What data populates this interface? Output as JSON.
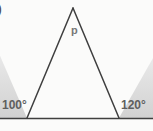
{
  "figure": {
    "item_marker": ")",
    "background_color": "#fbfbfa",
    "stroke_color": "#3f3f3f",
    "shade_color": "#d8d8d8",
    "label_color": "#6d6d6d",
    "apex_label": "p",
    "left_exterior_angle": "100°",
    "right_exterior_angle": "120°",
    "baseline_label": "baseline",
    "triangle": {
      "apex": [
        73,
        8
      ],
      "left_vertex": [
        27,
        118
      ],
      "right_vertex": [
        119,
        118
      ]
    },
    "baseline": {
      "x1": 0,
      "y1": 118,
      "x2": 153,
      "y2": 118
    },
    "shaded_sectors": [
      {
        "name": "left-exterior-angle-shade",
        "vertex": [
          27,
          118
        ],
        "value": "100°"
      },
      {
        "name": "right-exterior-angle-shade",
        "vertex": [
          119,
          118
        ],
        "value": "120°"
      }
    ]
  }
}
